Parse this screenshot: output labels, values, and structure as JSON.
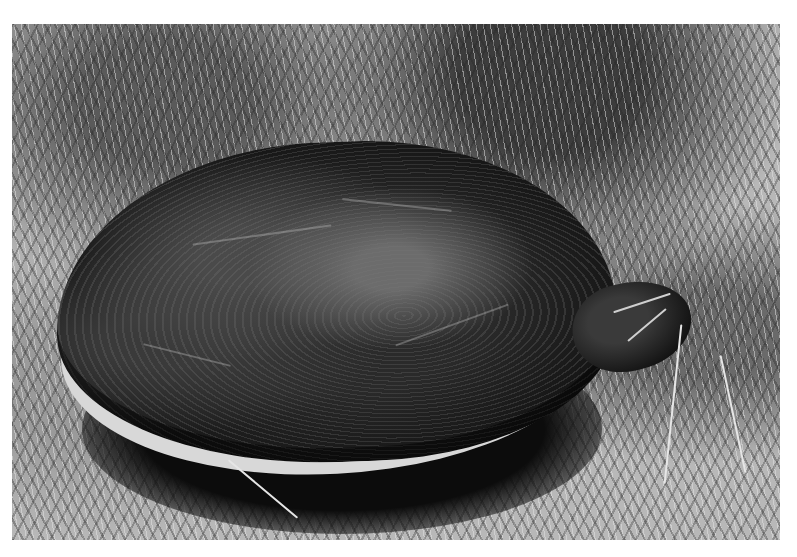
{
  "image": {
    "subject": "turtle",
    "description": "Black-and-white photograph of a turtle with a dark domed shell resting in short grass, head extended to the right",
    "colors": {
      "border": "#ffffff",
      "shell": "#1a1a1a",
      "grass_light": "#d0d0d0",
      "grass_dark": "#3a3a3a",
      "plastron_rim": "#d8d8d8"
    }
  }
}
